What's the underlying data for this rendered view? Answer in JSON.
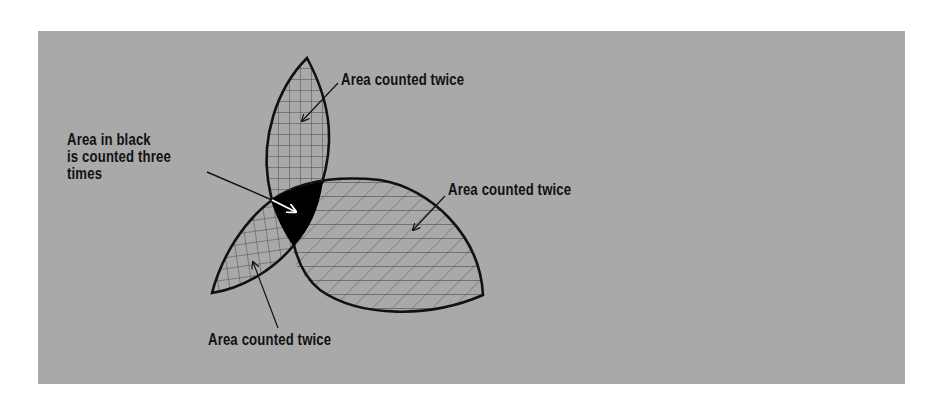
{
  "figure": {
    "type": "three-region-overlap-diagram",
    "background_color": "#a9a9a9",
    "stroke_color": "#111111",
    "labels": {
      "top": "Area counted twice",
      "right": "Area counted twice",
      "bottom": "Area counted twice",
      "center": "Area in black\nis counted three\ntimes"
    },
    "regions": [
      {
        "name": "top-petal",
        "hatch": "grid"
      },
      {
        "name": "left-petal",
        "hatch": "grid"
      },
      {
        "name": "right-petal",
        "hatch": "diagonal-grid"
      },
      {
        "name": "triple-overlap",
        "fill": "#000000"
      }
    ]
  }
}
